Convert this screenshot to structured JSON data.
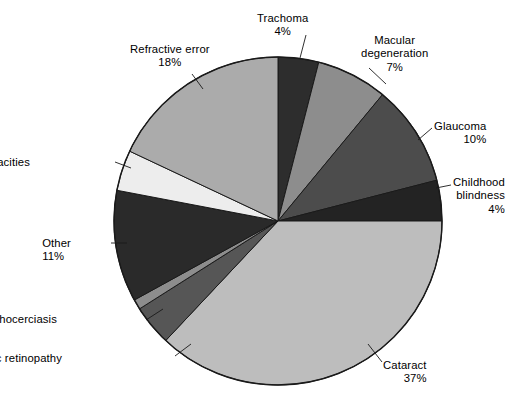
{
  "chart_data": {
    "type": "pie",
    "title": "",
    "subtitle": "",
    "xlabel": "",
    "ylabel": "",
    "legend_position": "none",
    "grid": false,
    "start_angle_deg": 0,
    "direction": "clockwise",
    "units": "percent",
    "total": 100,
    "categories": [
      "Trachoma",
      "Macular degeneration",
      "Glaucoma",
      "Childhood blindness",
      "Cataract",
      "Diabetic retinopathy",
      "Onchocerciasis",
      "Other",
      "Corneal opacities",
      "Refractive error"
    ],
    "values": [
      4,
      7,
      10,
      4,
      37,
      4,
      1,
      11,
      4,
      18
    ],
    "slices": [
      {
        "name": "Trachoma",
        "value": 4,
        "pct_label": "4%",
        "color": "#2d2d2d",
        "label_lines": [
          "Trachoma",
          "4%"
        ],
        "label_align": "center",
        "label_x": 257,
        "label_y": 12,
        "leader": [
          [
            306,
            35
          ],
          [
            300,
            58
          ]
        ]
      },
      {
        "name": "Macular degeneration",
        "value": 7,
        "pct_label": "7%",
        "color": "#8d8d8d",
        "label_lines": [
          "Macular",
          "degeneration",
          "7%"
        ],
        "label_align": "center",
        "label_x": 361,
        "label_y": 34,
        "leader": [
          [
            369,
            68
          ],
          [
            386,
            84
          ]
        ]
      },
      {
        "name": "Glaucoma",
        "value": 10,
        "pct_label": "10%",
        "color": "#4c4c4c",
        "label_lines": [
          "Glaucoma",
          "10%"
        ],
        "label_align": "left",
        "label_x": 434,
        "label_y": 120,
        "leader": [
          [
            432,
            128
          ],
          [
            418,
            140
          ]
        ]
      },
      {
        "name": "Childhood blindness",
        "value": 4,
        "pct_label": "4%",
        "color": "#232323",
        "label_lines": [
          "Childhood",
          "blindness",
          "4%"
        ],
        "label_align": "left",
        "label_x": 453,
        "label_y": 176,
        "leader": [
          [
            451,
            185
          ],
          [
            436,
            188
          ]
        ]
      },
      {
        "name": "Cataract",
        "value": 37,
        "pct_label": "37%",
        "color": "#bdbdbd",
        "label_lines": [
          "Cataract",
          "37%"
        ],
        "label_align": "left",
        "label_x": 383,
        "label_y": 359,
        "leader": [
          [
            382,
            362
          ],
          [
            368,
            344
          ]
        ]
      },
      {
        "name": "Diabetic retinopathy",
        "value": 4,
        "pct_label": "4%",
        "color": "#565656",
        "label_lines": [
          "Diabetic retinopathy",
          "4%"
        ],
        "label_align": "right",
        "label_x": 62,
        "label_y": 352,
        "leader": [
          [
            175,
            356
          ],
          [
            191,
            344
          ]
        ]
      },
      {
        "name": "Onchocerciasis",
        "value": 1,
        "pct_label": "1%",
        "color": "#8d8d8d",
        "label_lines": [
          "Onchocerciasis",
          "1%"
        ],
        "label_align": "right",
        "label_x": 57,
        "label_y": 313,
        "leader": [
          [
            146,
            320
          ],
          [
            163,
            309
          ]
        ]
      },
      {
        "name": "Other",
        "value": 11,
        "pct_label": "11%",
        "color": "#2a2a2a",
        "label_lines": [
          "Other",
          "11%"
        ],
        "label_align": "right",
        "label_x": 71,
        "label_y": 237,
        "leader": [
          [
            111,
            243
          ],
          [
            127,
            243
          ]
        ]
      },
      {
        "name": "Corneal opacities",
        "value": 4,
        "pct_label": "4%",
        "color": "#ededed",
        "label_lines": [
          "Corneal opacities",
          "4%"
        ],
        "label_align": "right",
        "label_x": 30,
        "label_y": 156,
        "leader": [
          [
            115,
            162
          ],
          [
            131,
            168
          ]
        ]
      },
      {
        "name": "Refractive error",
        "value": 18,
        "pct_label": "18%",
        "color": "#ababab",
        "label_lines": [
          "Refractive error",
          "18%"
        ],
        "label_align": "center",
        "label_x": 130,
        "label_y": 43,
        "leader": [
          [
            192,
            74
          ],
          [
            203,
            89
          ]
        ]
      }
    ],
    "geometry": {
      "center_x": 278,
      "center_y": 221,
      "radius": 164,
      "outline_color": "#1a1a1a",
      "background": "#ffffff"
    }
  }
}
